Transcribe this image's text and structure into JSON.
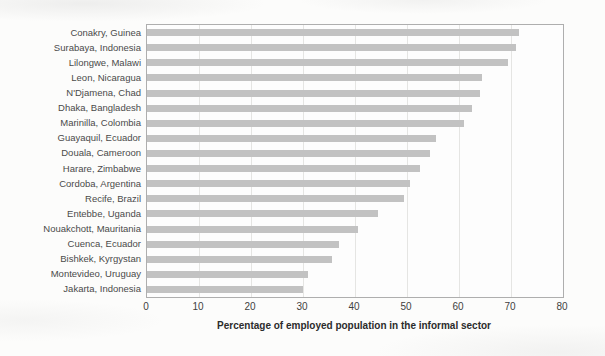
{
  "chart_data": {
    "type": "bar",
    "orientation": "horizontal",
    "title": "",
    "xlabel": "Percentage of employed population in the informal sector",
    "ylabel": "",
    "xlim": [
      0,
      80
    ],
    "xticks": [
      0,
      10,
      20,
      30,
      40,
      50,
      60,
      70,
      80
    ],
    "grid": "vertical-only",
    "legend": "none",
    "bar_color": "#c2c2c2",
    "gridline_color": "#e5e5e3",
    "plot_border_color": "#aeaeae",
    "categories": [
      "Conakry, Guinea",
      "Surabaya, Indonesia",
      "Lilongwe, Malawi",
      "Leon, Nicaragua",
      "N'Djamena, Chad",
      "Dhaka, Bangladesh",
      "Marinilla, Colombia",
      "Guayaquil, Ecuador",
      "Douala, Cameroon",
      "Harare, Zimbabwe",
      "Cordoba, Argentina",
      "Recife, Brazil",
      "Entebbe, Uganda",
      "Nouakchott, Mauritania",
      "Cuenca, Ecuador",
      "Bishkek, Kyrgystan",
      "Montevideo, Uruguay",
      "Jakarta, Indonesia"
    ],
    "values": [
      71.5,
      71,
      69.5,
      64.5,
      64,
      62.5,
      61,
      55.5,
      54.5,
      52.5,
      50.5,
      49.5,
      44.5,
      40.5,
      37,
      35.5,
      31,
      30
    ]
  }
}
